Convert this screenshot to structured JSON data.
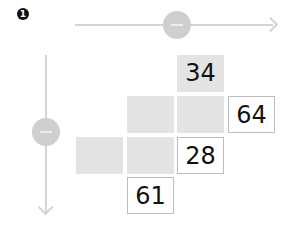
{
  "step_badge": "1",
  "horizontal_slider": {
    "label": "horizontal-slider",
    "knob_symbol": "minus"
  },
  "vertical_slider": {
    "label": "vertical-slider",
    "knob_symbol": "minus"
  },
  "grid": {
    "cells": [
      {
        "row": 1,
        "col": 3,
        "value": "34",
        "style": "grey"
      },
      {
        "row": 2,
        "col": 2,
        "value": "",
        "style": "grey"
      },
      {
        "row": 2,
        "col": 3,
        "value": "",
        "style": "grey"
      },
      {
        "row": 2,
        "col": 4,
        "value": "64",
        "style": "box"
      },
      {
        "row": 3,
        "col": 1,
        "value": "",
        "style": "grey"
      },
      {
        "row": 3,
        "col": 2,
        "value": "",
        "style": "grey"
      },
      {
        "row": 3,
        "col": 3,
        "value": "28",
        "style": "box"
      },
      {
        "row": 4,
        "col": 2,
        "value": "61",
        "style": "box"
      }
    ]
  },
  "colors": {
    "grey_cell": "#e3e3e3",
    "axis": "#d4d4d4",
    "knob": "#cfcfcf"
  }
}
